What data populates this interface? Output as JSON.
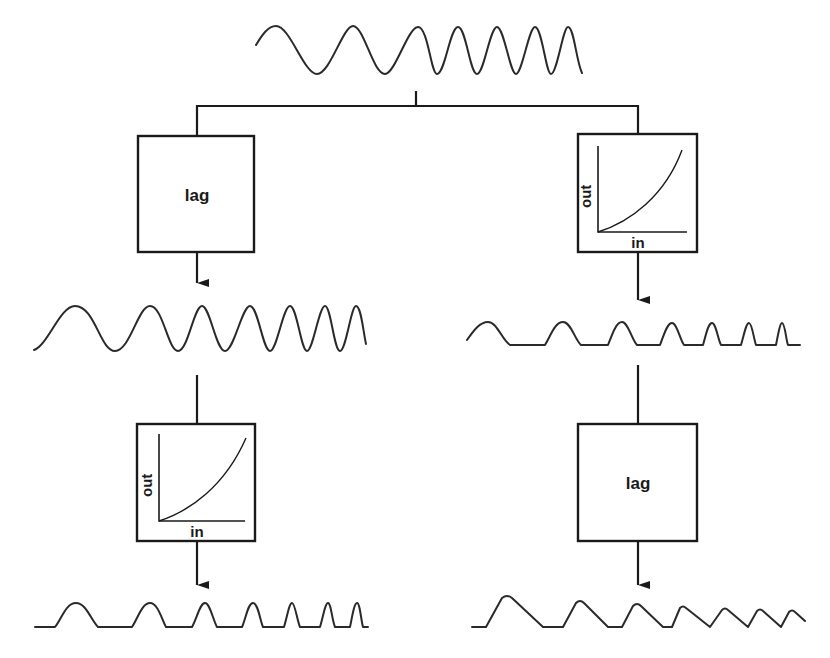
{
  "diagram": {
    "title": "",
    "input_signal": {
      "name": "chirp sinusoid input",
      "shape": "sine with increasing frequency"
    },
    "left_branch": {
      "stage1": {
        "type": "lag",
        "label": "lag"
      },
      "signal1": {
        "name": "lagged sinusoid",
        "shape": "sine with increasing frequency"
      },
      "stage2": {
        "type": "nonlinearity",
        "xlabel": "in",
        "ylabel": "out",
        "curve": "expansive (accelerating)"
      },
      "signal2": {
        "name": "rectified half-wave peaks",
        "shape": "rounded peaks on flat baseline"
      }
    },
    "right_branch": {
      "stage1": {
        "type": "nonlinearity",
        "xlabel": "in",
        "ylabel": "out",
        "curve": "expansive (accelerating)"
      },
      "signal1": {
        "name": "rectified half-wave peaks",
        "shape": "rounded peaks on flat baseline"
      },
      "stage2": {
        "type": "lag",
        "label": "lag"
      },
      "signal2": {
        "name": "lagged sawtooth-like peaks",
        "shape": "fast rise, slow decay"
      }
    }
  },
  "labels": {
    "lag_top_left": "lag",
    "lag_bottom_right": "lag",
    "nl_top_right_out": "out",
    "nl_top_right_in": "in",
    "nl_bottom_left_out": "out",
    "nl_bottom_left_in": "in"
  }
}
